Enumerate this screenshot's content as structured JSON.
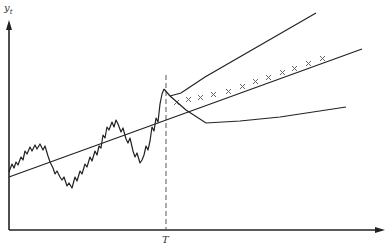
{
  "diagram": {
    "y_axis_label": "y",
    "y_axis_subscript": "t",
    "x_axis_marker_label": "T",
    "colors": {
      "line": "#222222",
      "dashed": "#555555",
      "marker": "#666666",
      "background": "#ffffff"
    },
    "elements": [
      "observed series (random walk with upward drift)",
      "linear trend line",
      "vertical dashed line at forecast origin T",
      "point forecasts marked with x along trend",
      "upper forecast bound",
      "lower forecast bound"
    ]
  }
}
